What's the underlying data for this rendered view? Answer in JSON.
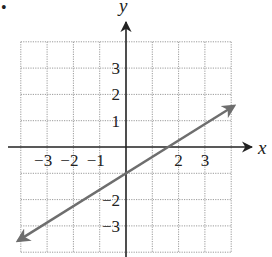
{
  "chart_data": {
    "type": "line",
    "title": "",
    "xlabel": "x",
    "ylabel": "y",
    "xlim": [
      -4,
      4
    ],
    "ylim": [
      -4,
      4
    ],
    "grid": true,
    "x_ticks": [
      {
        "value": -3,
        "label": "−3"
      },
      {
        "value": -2,
        "label": "−2"
      },
      {
        "value": -1,
        "label": "−1"
      },
      {
        "value": 2,
        "label": "2"
      },
      {
        "value": 3,
        "label": "3"
      }
    ],
    "y_ticks": [
      {
        "value": 3,
        "label": "3"
      },
      {
        "value": 2,
        "label": "2"
      },
      {
        "value": 1,
        "label": "1"
      },
      {
        "value": -2,
        "label": "−2"
      },
      {
        "value": -3,
        "label": "−3"
      }
    ],
    "series": [
      {
        "name": "line",
        "equation": "y = (5/8)x - 1",
        "slope": 0.625,
        "y_intercept": -1,
        "x_intercept": 1.6,
        "points": [
          [
            -4.1,
            -3.56
          ],
          [
            0,
            -1
          ],
          [
            1.6,
            0
          ],
          [
            4.1,
            1.56
          ]
        ],
        "arrows_both_ends": true,
        "color": "#6e6e6e"
      }
    ],
    "legend": null
  },
  "labels": {
    "bullet": "•"
  },
  "colors": {
    "axis": "#222222",
    "grid": "#9a9a9a",
    "line": "#6e6e6e"
  }
}
